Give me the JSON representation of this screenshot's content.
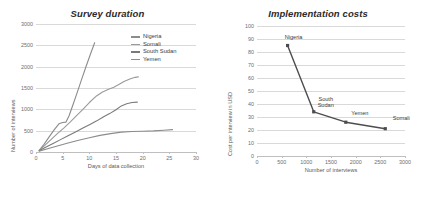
{
  "figures": {
    "left": {
      "title": "Survey duration",
      "xlabel": "Days of data collection",
      "ylabel": "Number of interviews",
      "legend": [
        {
          "label": "Nigeria",
          "color": "#8c8c8c"
        },
        {
          "label": "Somali",
          "color": "#9a9a9a"
        },
        {
          "label": "South Sudan",
          "color": "#7a7a7a"
        },
        {
          "label": "Yemen",
          "color": "#8c8c8c"
        }
      ]
    },
    "right": {
      "title": "Implementation costs",
      "xlabel": "Number of interviews",
      "ylabel": "Cost per interview in USD"
    }
  },
  "chart_data": [
    {
      "type": "line",
      "id": "survey-duration",
      "title": "Survey duration",
      "xlabel": "Days of data collection",
      "ylabel": "Number of interviews",
      "xlim": [
        0,
        30
      ],
      "ylim": [
        0,
        3000
      ],
      "xticks": [
        0,
        5,
        10,
        15,
        20,
        25,
        30
      ],
      "yticks": [
        0,
        500,
        1000,
        1500,
        2000,
        2500,
        3000
      ],
      "grid": true,
      "legend_position": "top-right",
      "series": [
        {
          "name": "Nigeria",
          "color": "#8c8c8c",
          "points": [
            [
              0.6,
              40
            ],
            [
              1.5,
              180
            ],
            [
              2.5,
              360
            ],
            [
              3.4,
              520
            ],
            [
              4.3,
              660
            ],
            [
              5.0,
              690
            ],
            [
              5.6,
              700
            ],
            [
              6.2,
              850
            ],
            [
              7.0,
              1130
            ],
            [
              7.8,
              1420
            ],
            [
              8.6,
              1720
            ],
            [
              9.4,
              2010
            ],
            [
              10.2,
              2290
            ],
            [
              11.0,
              2560
            ]
          ]
        },
        {
          "name": "Somali",
          "color": "#9a9a9a",
          "points": [
            [
              0.6,
              35
            ],
            [
              1.6,
              150
            ],
            [
              2.8,
              290
            ],
            [
              4.0,
              430
            ],
            [
              5.2,
              560
            ],
            [
              6.4,
              700
            ],
            [
              7.6,
              850
            ],
            [
              8.8,
              1000
            ],
            [
              10.0,
              1160
            ],
            [
              11.2,
              1300
            ],
            [
              12.4,
              1400
            ],
            [
              13.6,
              1470
            ],
            [
              14.6,
              1520
            ],
            [
              15.6,
              1590
            ],
            [
              16.6,
              1660
            ],
            [
              17.6,
              1710
            ],
            [
              18.6,
              1750
            ],
            [
              19.2,
              1760
            ]
          ]
        },
        {
          "name": "South Sudan",
          "color": "#7a7a7a",
          "points": [
            [
              0.6,
              30
            ],
            [
              1.8,
              110
            ],
            [
              3.2,
              200
            ],
            [
              4.6,
              290
            ],
            [
              6.0,
              380
            ],
            [
              7.4,
              470
            ],
            [
              8.8,
              560
            ],
            [
              10.2,
              650
            ],
            [
              11.4,
              730
            ],
            [
              12.6,
              820
            ],
            [
              13.8,
              900
            ],
            [
              15.0,
              990
            ],
            [
              16.0,
              1080
            ],
            [
              17.0,
              1130
            ],
            [
              18.0,
              1160
            ],
            [
              19.0,
              1170
            ]
          ]
        },
        {
          "name": "Yemen",
          "color": "#8c8c8c",
          "points": [
            [
              0.6,
              20
            ],
            [
              2.0,
              70
            ],
            [
              4.0,
              140
            ],
            [
              6.0,
              210
            ],
            [
              8.0,
              275
            ],
            [
              10.0,
              335
            ],
            [
              12.0,
              390
            ],
            [
              14.0,
              430
            ],
            [
              16.0,
              465
            ],
            [
              18.0,
              480
            ],
            [
              20.0,
              488
            ],
            [
              22.0,
              495
            ],
            [
              24.0,
              510
            ],
            [
              25.6,
              525
            ]
          ]
        }
      ]
    },
    {
      "type": "line",
      "id": "implementation-costs",
      "title": "Implementation costs",
      "xlabel": "Number of interviews",
      "ylabel": "Cost per interview in USD",
      "xlim": [
        0,
        3000
      ],
      "ylim": [
        0,
        100
      ],
      "xticks": [
        0,
        500,
        1000,
        1500,
        2000,
        2500,
        3000
      ],
      "yticks": [
        0,
        10,
        20,
        30,
        40,
        50,
        60,
        70,
        80,
        90,
        100
      ],
      "grid": true,
      "marker": "square",
      "color": "#4d4d4d",
      "points": [
        {
          "x": 620,
          "y": 85,
          "label": "Nigeria"
        },
        {
          "x": 1150,
          "y": 34,
          "label": "South\nSudan"
        },
        {
          "x": 1800,
          "y": 26,
          "label": "Yemen"
        },
        {
          "x": 2600,
          "y": 21,
          "label": "Somali"
        }
      ]
    }
  ]
}
